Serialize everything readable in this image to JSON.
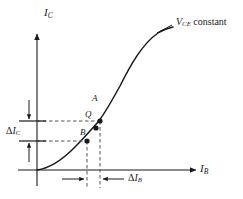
{
  "figure": {
    "type": "diagram",
    "background_color": "#ffffff",
    "line_color": "#1a1a1a",
    "dashed_color": "#555555"
  },
  "axes": {
    "y_label_main": "I",
    "y_label_sub": "C",
    "x_label_main": "I",
    "x_label_sub": "B",
    "origin_px": {
      "x": 37,
      "y": 170
    }
  },
  "curve": {
    "name": "collector-current-vs-base-current",
    "shape": "s-curve",
    "path": "M 37,170 C 52,168 64,158 74,148 C 84,138 91,130 98,122 C 106,112 112,100 120,86 C 130,66 142,44 158,33 C 164,29 169,28 173,27"
  },
  "annotation": {
    "note_main": "V",
    "note_sub": "CE",
    "note_tail": " constant",
    "leader_line": {
      "x1": 157,
      "y1": 33,
      "x2": 172,
      "y2": 25
    }
  },
  "points": [
    {
      "id": "A",
      "label": "A",
      "x": 100,
      "y": 121,
      "label_x": 92,
      "label_y": 108
    },
    {
      "id": "Q",
      "label": "Q",
      "x": 96,
      "y": 128,
      "label_x": 85,
      "label_y": 124
    },
    {
      "id": "B",
      "label": "B",
      "x": 87,
      "y": 141,
      "label_x": 80,
      "label_y": 142
    }
  ],
  "measurements": {
    "delta_ic": {
      "symbol": "Δ",
      "main": "I",
      "sub": "C",
      "label_x": 6,
      "label_y": 126,
      "top_line_y": 121,
      "bottom_line_y": 141,
      "bracket_x": 29,
      "bracket_top_y": 100,
      "bracket_bottom_y": 162
    },
    "delta_ib": {
      "symbol": "Δ",
      "main": "I",
      "sub": "B",
      "label_x": 126,
      "label_y": 178,
      "left_line_x": 87,
      "right_line_x": 100,
      "arrow_row_y": 179,
      "left_arrow_from_x": 62,
      "right_arrow_from_x": 124
    }
  },
  "dashed_guides": [
    {
      "name": "horizontal-A",
      "x1": 37,
      "y1": 121,
      "x2": 100,
      "y2": 121
    },
    {
      "name": "horizontal-B",
      "x1": 37,
      "y1": 141,
      "x2": 87,
      "y2": 141
    },
    {
      "name": "vertical-A",
      "x1": 100,
      "y1": 121,
      "x2": 100,
      "y2": 188
    },
    {
      "name": "vertical-B",
      "x1": 87,
      "y1": 141,
      "x2": 87,
      "y2": 188
    }
  ]
}
